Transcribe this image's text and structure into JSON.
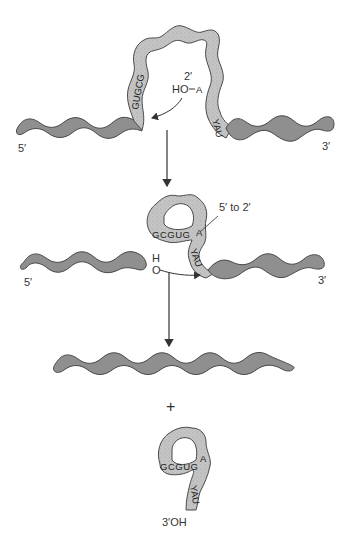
{
  "colors": {
    "exon": "#8f8f8f",
    "intron": "#c4c4c4",
    "outline": "#4a4a4a",
    "arrow": "#333333",
    "background": "#ffffff"
  },
  "stage1": {
    "label_5prime": "5′",
    "label_3prime": "3′",
    "label_2prime": "2′",
    "label_ho": "HO",
    "branch_a": "A",
    "left_seq": "GUGCG",
    "right_seq": "YAU"
  },
  "stage2": {
    "label_5prime": "5′",
    "label_3prime": "3′",
    "label_5to2": "5′ to 2′",
    "label_h": "H",
    "label_o": "O",
    "loop_seq": "GCGUG",
    "branch_a": "A",
    "tail_seq": "YAU"
  },
  "stage3": {
    "plus": "+",
    "lariat_seq": "GCGUG",
    "branch_a": "A",
    "tail_seq": "YAU",
    "label_3oh": "3′OH"
  }
}
